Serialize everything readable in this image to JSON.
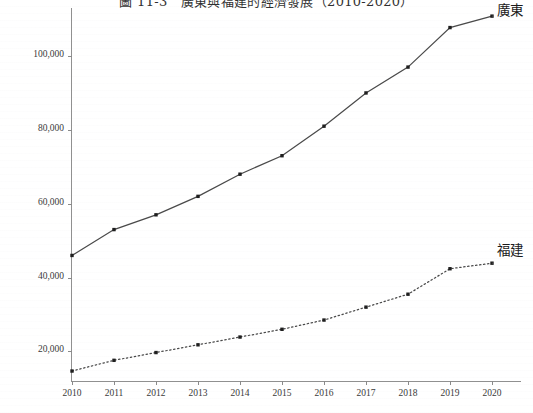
{
  "chart_data": {
    "type": "line",
    "title": "圖 11-3　廣東與福建的經濟發展（2010-2020）",
    "xlabel": "",
    "ylabel": "",
    "x": [
      2010,
      2011,
      2012,
      2013,
      2014,
      2015,
      2016,
      2017,
      2018,
      2019,
      2020
    ],
    "categories": [
      "2010",
      "2011",
      "2012",
      "2013",
      "2014",
      "2015",
      "2016",
      "2017",
      "2018",
      "2019",
      "2020"
    ],
    "xlim": [
      2010,
      2020
    ],
    "ylim": [
      12000,
      113000
    ],
    "yticks": [
      20000,
      40000,
      60000,
      80000,
      100000
    ],
    "ytick_labels": [
      "20,000",
      "40,000",
      "60,000",
      "80,000",
      "100,000"
    ],
    "grid": false,
    "legend_position": "inline-right-end-of-line",
    "series": [
      {
        "name": "廣東",
        "style": "solid",
        "color": "#4a4a4a",
        "marker": "square",
        "values": [
          46000,
          53000,
          57000,
          62000,
          68000,
          73000,
          81000,
          90000,
          97000,
          107700,
          110800
        ]
      },
      {
        "name": "福建",
        "style": "dotted",
        "color": "#4a4a4a",
        "marker": "square",
        "values": [
          14700,
          17600,
          19700,
          21800,
          23900,
          26000,
          28500,
          32000,
          35500,
          42400,
          43900
        ]
      }
    ],
    "annotations": [
      {
        "text": "廣東",
        "x": 2020,
        "y": 110800,
        "placement": "right"
      },
      {
        "text": "福建",
        "x": 2020,
        "y": 43900,
        "placement": "right"
      }
    ]
  }
}
